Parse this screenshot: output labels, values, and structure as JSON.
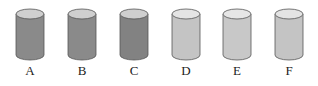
{
  "cylinders": [
    {
      "label": "A",
      "body_color": "#8a8a8a",
      "top_color": "#cfcfcf",
      "x": 15
    },
    {
      "label": "B",
      "body_color": "#8a8a8a",
      "top_color": "#cfcfcf",
      "x": 67
    },
    {
      "label": "C",
      "body_color": "#828282",
      "top_color": "#cfcfcf",
      "x": 119
    },
    {
      "label": "D",
      "body_color": "#c4c4c4",
      "top_color": "#e4e4e4",
      "x": 171
    },
    {
      "label": "E",
      "body_color": "#c8c8c8",
      "top_color": "#e6e6e6",
      "x": 222
    },
    {
      "label": "F",
      "body_color": "#c4c4c4",
      "top_color": "#e4e4e4",
      "x": 274
    }
  ]
}
